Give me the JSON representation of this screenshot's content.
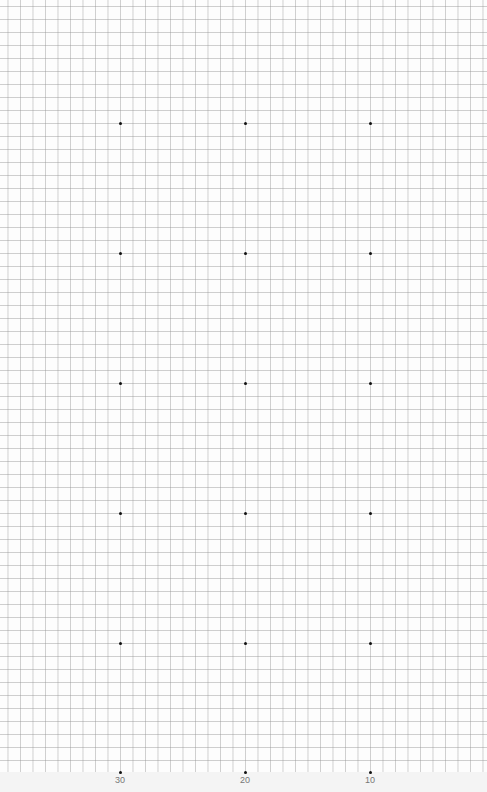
{
  "grid": {
    "cell_px": 12.5,
    "line_color": "#969696"
  },
  "dots": {
    "columns_x": [
      120,
      245,
      370
    ],
    "rows_y": [
      123,
      253,
      383,
      513,
      643,
      772
    ]
  },
  "axis_labels": [
    {
      "text": "30",
      "x": 120
    },
    {
      "text": "20",
      "x": 245
    },
    {
      "text": "10",
      "x": 370
    }
  ]
}
